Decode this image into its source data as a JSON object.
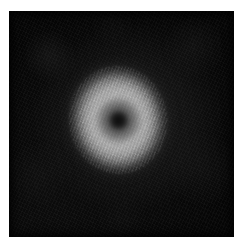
{
  "image": {
    "title": "Grayscale ring-shaped blob on dark field",
    "modality": "grayscale-micrograph",
    "frame": {
      "margin_left_px": 9,
      "margin_top_px": 11,
      "field_width_px": 225,
      "field_height_px": 226,
      "page_width_px": 240,
      "page_height_px": 249,
      "page_background_color": "#ffffff"
    },
    "background": {
      "label": "dark textured field",
      "base_color": "#070707",
      "brightest_color": "#282828",
      "texture": "fine diagonal speckle grain"
    },
    "feature": {
      "label": "bright elliptical ring",
      "shape": "ellipse",
      "center_x_px": 118,
      "center_y_px": 120,
      "width_px": 98,
      "height_px": 108,
      "rotation_deg": -8,
      "rim_color": "#b1b1b1",
      "midtone_color": "#8f8f8f",
      "annulus_color": "#4a4a4a",
      "core_color": "#0a0a0a",
      "core_diameter_px": 17,
      "annulus_diameter_px": 45,
      "texture": "concentric speckle fringes"
    },
    "caption": ""
  }
}
